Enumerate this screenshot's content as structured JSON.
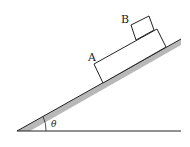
{
  "diagram": {
    "type": "physics-incline",
    "labels": {
      "block_a": "A",
      "block_b": "B",
      "angle": "θ"
    },
    "colors": {
      "line": "#222222",
      "incline_shade": "#b8b8b8",
      "background": "#ffffff"
    },
    "elements": [
      {
        "name": "ground",
        "description": "horizontal base line"
      },
      {
        "name": "incline",
        "description": "inclined plane at angle θ, shaded underside"
      },
      {
        "name": "block-a",
        "description": "long rectangular block resting on incline"
      },
      {
        "name": "block-b",
        "description": "small square block resting on top of A near its upper end"
      },
      {
        "name": "angle-arc",
        "description": "arc marking angle θ at the base"
      }
    ]
  }
}
